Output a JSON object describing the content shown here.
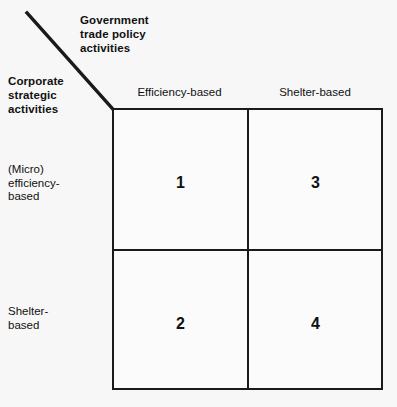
{
  "figure": {
    "axis_titles": {
      "columns": "Government\ntrade policy\nactivities",
      "rows": "Corporate\nstrategic\nactivities"
    },
    "column_headers": [
      "Efficiency-based",
      "Shelter-based"
    ],
    "row_labels": [
      "(Micro)\nefficiency-\nbased",
      "Shelter-\nbased"
    ],
    "cells": [
      {
        "number": "1",
        "row": "(Micro) efficiency-based",
        "column": "Efficiency-based"
      },
      {
        "number": "3",
        "row": "(Micro) efficiency-based",
        "column": "Shelter-based"
      },
      {
        "number": "2",
        "row": "Shelter-based",
        "column": "Efficiency-based"
      },
      {
        "number": "4",
        "row": "Shelter-based",
        "column": "Shelter-based"
      }
    ],
    "colors": {
      "line": "#1a1a1a",
      "background": "#f7f7f7",
      "cell_fill": "#fbfbfb",
      "text": "#111111"
    }
  }
}
